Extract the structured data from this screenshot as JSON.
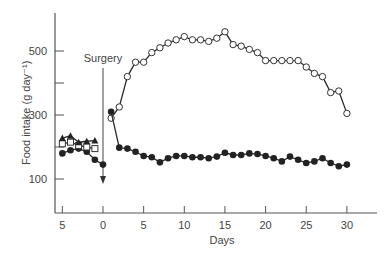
{
  "chart_data": {
    "type": "line",
    "title": "",
    "xlabel": "Days",
    "ylabel": "Food intake (g day⁻¹)",
    "xlim": [
      -6,
      34
    ],
    "ylim": [
      0,
      620
    ],
    "x_ticks": [
      {
        "value": -5,
        "label": "5"
      },
      {
        "value": 0,
        "label": "0"
      },
      {
        "value": 5,
        "label": "5"
      },
      {
        "value": 10,
        "label": "10"
      },
      {
        "value": 15,
        "label": "15"
      },
      {
        "value": 20,
        "label": "20"
      },
      {
        "value": 25,
        "label": "25"
      },
      {
        "value": 30,
        "label": "30"
      }
    ],
    "y_ticks": [
      {
        "value": 100,
        "label": "100"
      },
      {
        "value": 200,
        "label": ""
      },
      {
        "value": 300,
        "label": "300"
      },
      {
        "value": 400,
        "label": ""
      },
      {
        "value": 500,
        "label": "500"
      }
    ],
    "grid": false,
    "legend": null,
    "annotations": [
      {
        "text": "Surgery",
        "x": 0,
        "type": "downward-arrow",
        "from_y": 490,
        "to_y": 95
      }
    ],
    "series": [
      {
        "name": "open-circles",
        "marker": "open-circle",
        "x": [
          1,
          2,
          3,
          4,
          5,
          6,
          7,
          8,
          9,
          10,
          11,
          12,
          13,
          14,
          15,
          16,
          17,
          18,
          19,
          20,
          21,
          22,
          23,
          24,
          25,
          26,
          27,
          28,
          29,
          30
        ],
        "y": [
          290,
          325,
          420,
          465,
          465,
          495,
          510,
          525,
          535,
          545,
          535,
          535,
          530,
          540,
          560,
          520,
          515,
          505,
          495,
          470,
          470,
          470,
          470,
          470,
          450,
          430,
          420,
          370,
          375,
          305
        ]
      },
      {
        "name": "filled-circles",
        "marker": "filled-circle",
        "x": [
          -5,
          -4,
          -3,
          -2,
          -1,
          0,
          1,
          2,
          3,
          4,
          5,
          6,
          7,
          8,
          9,
          10,
          11,
          12,
          13,
          14,
          15,
          16,
          17,
          18,
          19,
          20,
          21,
          22,
          23,
          24,
          25,
          26,
          27,
          28,
          29,
          30
        ],
        "y": [
          180,
          190,
          195,
          185,
          160,
          145,
          310,
          198,
          195,
          185,
          172,
          168,
          152,
          165,
          172,
          172,
          168,
          168,
          165,
          170,
          182,
          175,
          175,
          180,
          178,
          172,
          165,
          155,
          170,
          160,
          150,
          155,
          165,
          150,
          140,
          145
        ]
      },
      {
        "name": "open-squares",
        "marker": "open-square",
        "x": [
          -5,
          -4,
          -3,
          -2,
          -1
        ],
        "y": [
          210,
          215,
          205,
          200,
          195
        ]
      },
      {
        "name": "filled-triangles",
        "marker": "filled-triangle",
        "x": [
          -5,
          -4,
          -3,
          -2,
          -1
        ],
        "y": [
          228,
          235,
          215,
          218,
          220
        ]
      }
    ]
  }
}
